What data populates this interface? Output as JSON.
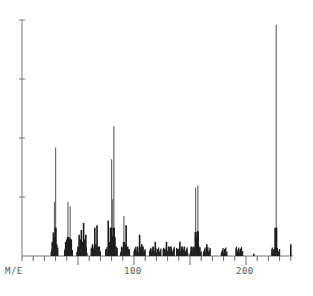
{
  "chart_data": {
    "type": "bar",
    "title": "",
    "xlabel": "M/E",
    "ylabel": "",
    "x_tick_labels": [
      "100",
      "200"
    ],
    "xlim": [
      0,
      240
    ],
    "ylim": [
      0,
      100
    ],
    "grid": false,
    "legend": null,
    "y_ticks": [
      25,
      50,
      75,
      100
    ],
    "peaks": [
      {
        "mz": 27,
        "intensity": 6
      },
      {
        "mz": 28,
        "intensity": 10
      },
      {
        "mz": 29,
        "intensity": 23
      },
      {
        "mz": 30,
        "intensity": 46
      },
      {
        "mz": 31,
        "intensity": 5
      },
      {
        "mz": 39,
        "intensity": 6
      },
      {
        "mz": 40,
        "intensity": 7
      },
      {
        "mz": 41,
        "intensity": 23
      },
      {
        "mz": 42,
        "intensity": 8
      },
      {
        "mz": 43,
        "intensity": 21
      },
      {
        "mz": 44,
        "intensity": 7
      },
      {
        "mz": 50,
        "intensity": 4
      },
      {
        "mz": 51,
        "intensity": 9
      },
      {
        "mz": 52,
        "intensity": 7
      },
      {
        "mz": 53,
        "intensity": 11
      },
      {
        "mz": 54,
        "intensity": 6
      },
      {
        "mz": 55,
        "intensity": 14
      },
      {
        "mz": 56,
        "intensity": 7
      },
      {
        "mz": 57,
        "intensity": 9
      },
      {
        "mz": 62,
        "intensity": 3
      },
      {
        "mz": 63,
        "intensity": 5
      },
      {
        "mz": 65,
        "intensity": 12
      },
      {
        "mz": 66,
        "intensity": 5
      },
      {
        "mz": 67,
        "intensity": 13
      },
      {
        "mz": 68,
        "intensity": 4
      },
      {
        "mz": 69,
        "intensity": 4
      },
      {
        "mz": 75,
        "intensity": 3
      },
      {
        "mz": 77,
        "intensity": 15
      },
      {
        "mz": 78,
        "intensity": 6
      },
      {
        "mz": 79,
        "intensity": 12
      },
      {
        "mz": 80,
        "intensity": 41
      },
      {
        "mz": 81,
        "intensity": 24
      },
      {
        "mz": 82,
        "intensity": 55
      },
      {
        "mz": 83,
        "intensity": 8
      },
      {
        "mz": 84,
        "intensity": 4
      },
      {
        "mz": 89,
        "intensity": 4
      },
      {
        "mz": 91,
        "intensity": 17
      },
      {
        "mz": 92,
        "intensity": 5
      },
      {
        "mz": 93,
        "intensity": 13
      },
      {
        "mz": 94,
        "intensity": 4
      },
      {
        "mz": 95,
        "intensity": 3
      },
      {
        "mz": 101,
        "intensity": 3
      },
      {
        "mz": 103,
        "intensity": 4
      },
      {
        "mz": 105,
        "intensity": 9
      },
      {
        "mz": 106,
        "intensity": 3
      },
      {
        "mz": 107,
        "intensity": 5
      },
      {
        "mz": 108,
        "intensity": 4
      },
      {
        "mz": 115,
        "intensity": 3
      },
      {
        "mz": 117,
        "intensity": 4
      },
      {
        "mz": 119,
        "intensity": 6
      },
      {
        "mz": 121,
        "intensity": 3
      },
      {
        "mz": 127,
        "intensity": 3
      },
      {
        "mz": 129,
        "intensity": 6
      },
      {
        "mz": 131,
        "intensity": 4
      },
      {
        "mz": 133,
        "intensity": 4
      },
      {
        "mz": 139,
        "intensity": 3
      },
      {
        "mz": 141,
        "intensity": 6
      },
      {
        "mz": 143,
        "intensity": 4
      },
      {
        "mz": 145,
        "intensity": 4
      },
      {
        "mz": 151,
        "intensity": 4
      },
      {
        "mz": 153,
        "intensity": 4
      },
      {
        "mz": 155,
        "intensity": 29
      },
      {
        "mz": 156,
        "intensity": 8
      },
      {
        "mz": 157,
        "intensity": 30
      },
      {
        "mz": 158,
        "intensity": 4
      },
      {
        "mz": 163,
        "intensity": 2
      },
      {
        "mz": 165,
        "intensity": 5
      },
      {
        "mz": 166,
        "intensity": 2
      },
      {
        "mz": 179,
        "intensity": 2
      },
      {
        "mz": 181,
        "intensity": 3
      },
      {
        "mz": 193,
        "intensity": 2
      },
      {
        "mz": 195,
        "intensity": 3
      },
      {
        "mz": 207,
        "intensity": 1
      },
      {
        "mz": 225,
        "intensity": 3
      },
      {
        "mz": 226,
        "intensity": 12
      },
      {
        "mz": 227,
        "intensity": 98
      },
      {
        "mz": 228,
        "intensity": 3
      },
      {
        "mz": 240,
        "intensity": 5
      }
    ]
  },
  "axis": {
    "x_label": "M/E",
    "tick_100": "100",
    "tick_200": "200"
  }
}
